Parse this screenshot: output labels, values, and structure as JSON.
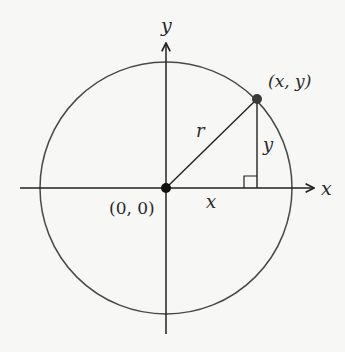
{
  "diagram": {
    "type": "unit-circle-coordinate",
    "labels": {
      "y_axis": "y",
      "x_axis": "x",
      "point": "(x, y)",
      "origin": "(0, 0)",
      "radius": "r",
      "leg_vertical": "y",
      "leg_horizontal": "x"
    },
    "geometry": {
      "origin": [
        166,
        188
      ],
      "radius": 126,
      "point": [
        257,
        99
      ],
      "x_axis_range": [
        20,
        316
      ],
      "y_axis_range": [
        42,
        334
      ]
    },
    "colors": {
      "stroke": "#4a4a4a",
      "axis": "#222222",
      "point": "#3a3a3a",
      "background": "#f7f7f5"
    }
  }
}
